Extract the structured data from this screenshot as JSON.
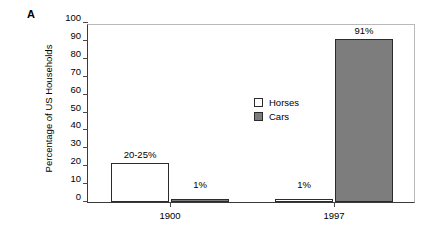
{
  "panel": {
    "letter": "A"
  },
  "chart_data": {
    "type": "bar",
    "title": "",
    "xlabel": "",
    "ylabel": "Percentage of US Households",
    "categories": [
      "1900",
      "1997"
    ],
    "ylim": [
      0,
      100
    ],
    "yticks": [
      0,
      10,
      20,
      30,
      40,
      50,
      60,
      70,
      80,
      90,
      100
    ],
    "ytick_labels": [
      "0",
      "10",
      "20",
      "30",
      "40",
      "50",
      "60",
      "70",
      "80",
      "90",
      "100"
    ],
    "grid": false,
    "legend_position": "inside-upper-center-left",
    "series": [
      {
        "name": "Horses",
        "color": "#ffffff",
        "values": [
          22,
          1
        ],
        "data_labels": [
          "20-25%",
          "1%"
        ]
      },
      {
        "name": "Cars",
        "color": "#7d7d7d",
        "values": [
          1,
          91
        ],
        "data_labels": [
          "1%",
          "91%"
        ]
      }
    ],
    "legend": [
      "Horses",
      "Cars"
    ]
  },
  "colors": {
    "horses_fill": "#ffffff",
    "cars_fill": "#7d7d7d",
    "bar_edge": "#2b2b2b",
    "axis": "#3a3a3a",
    "frame_light": "#b9b9b9"
  }
}
